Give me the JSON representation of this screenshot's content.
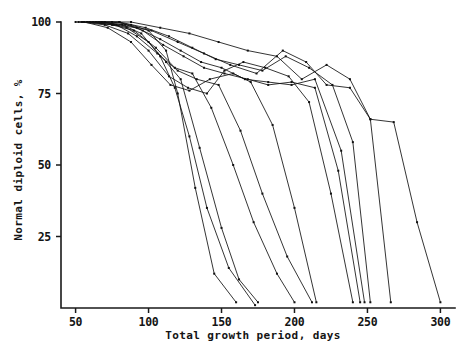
{
  "figure": {
    "width": 475,
    "height": 355,
    "background": "#ffffff",
    "ink_color": "#111111"
  },
  "chart_data": {
    "type": "line",
    "title": "",
    "subtitle": "",
    "xlabel": "Total growth period, days",
    "ylabel": "Normal diploid cells, %",
    "xlim": [
      40,
      310
    ],
    "ylim": [
      0,
      100
    ],
    "xticks": [
      50,
      100,
      150,
      200,
      250,
      300
    ],
    "xticklabels": [
      "50",
      "100",
      "150",
      "200",
      "250",
      "300"
    ],
    "yticks": [
      25,
      50,
      75,
      100
    ],
    "yticklabels": [
      "25",
      "50",
      "75",
      "100"
    ],
    "grid": false,
    "legend": false,
    "legend_position": "none",
    "marker": "square",
    "marker_size": 2.0,
    "axis_style": "left-and-bottom-spines-only",
    "tick_direction": "out",
    "annotations": [],
    "series": [
      {
        "name": "culture-1",
        "x": [
          50,
          62,
          75,
          88,
          100,
          112,
          120,
          132,
          145,
          160
        ],
        "values": [
          100,
          100,
          100,
          99,
          97,
          90,
          75,
          42,
          12,
          2
        ]
      },
      {
        "name": "culture-2",
        "x": [
          52,
          68,
          82,
          95,
          108,
          118,
          128,
          140,
          155,
          173
        ],
        "values": [
          100,
          100,
          99,
          96,
          88,
          77,
          60,
          35,
          14,
          1
        ]
      },
      {
        "name": "culture-3",
        "x": [
          55,
          70,
          85,
          100,
          112,
          122,
          135,
          150,
          162,
          175
        ],
        "values": [
          100,
          100,
          98,
          93,
          86,
          80,
          56,
          28,
          10,
          2
        ]
      },
      {
        "name": "culture-4",
        "x": [
          58,
          75,
          90,
          105,
          118,
          130,
          143,
          158,
          172,
          188,
          200
        ],
        "values": [
          100,
          99,
          97,
          91,
          84,
          82,
          70,
          50,
          30,
          12,
          2
        ]
      },
      {
        "name": "culture-5",
        "x": [
          60,
          78,
          92,
          106,
          120,
          133,
          148,
          163,
          178,
          195,
          212
        ],
        "values": [
          100,
          99,
          95,
          89,
          83,
          80,
          78,
          62,
          40,
          18,
          2
        ]
      },
      {
        "name": "culture-6",
        "x": [
          56,
          72,
          88,
          102,
          115,
          128,
          142,
          158,
          170,
          185,
          200,
          215
        ],
        "values": [
          100,
          98,
          93,
          85,
          78,
          76,
          80,
          82,
          79,
          64,
          35,
          2
        ]
      },
      {
        "name": "culture-7",
        "x": [
          54,
          70,
          86,
          100,
          114,
          127,
          140,
          152,
          165,
          180,
          196,
          210,
          225,
          240
        ],
        "values": [
          100,
          99,
          96,
          90,
          81,
          77,
          75,
          83,
          86,
          84,
          81,
          72,
          40,
          2
        ]
      },
      {
        "name": "culture-8",
        "x": [
          62,
          80,
          96,
          110,
          124,
          138,
          152,
          168,
          182,
          198,
          214,
          230,
          245
        ],
        "values": [
          100,
          100,
          97,
          92,
          88,
          84,
          82,
          80,
          78,
          79,
          77,
          48,
          2
        ]
      },
      {
        "name": "culture-9",
        "x": [
          58,
          76,
          92,
          108,
          122,
          136,
          150,
          166,
          182,
          198,
          214,
          232,
          248
        ],
        "values": [
          100,
          99,
          98,
          94,
          90,
          86,
          84,
          80,
          79,
          78,
          80,
          55,
          2
        ]
      },
      {
        "name": "culture-10",
        "x": [
          60,
          80,
          98,
          114,
          130,
          146,
          162,
          178,
          194,
          210,
          226,
          240,
          252
        ],
        "values": [
          100,
          100,
          98,
          95,
          91,
          87,
          85,
          83,
          88,
          84,
          78,
          58,
          2
        ]
      },
      {
        "name": "culture-11",
        "x": [
          64,
          84,
          102,
          120,
          138,
          156,
          174,
          192,
          208,
          222,
          238,
          252,
          266
        ],
        "values": [
          100,
          99,
          97,
          93,
          89,
          85,
          82,
          90,
          86,
          78,
          77,
          66,
          2
        ]
      },
      {
        "name": "culture-12",
        "x": [
          66,
          88,
          108,
          128,
          148,
          168,
          188,
          205,
          222,
          238,
          252,
          268,
          284,
          300
        ],
        "values": [
          100,
          100,
          98,
          96,
          93,
          90,
          88,
          80,
          85,
          80,
          66,
          65,
          30,
          2
        ]
      }
    ]
  }
}
